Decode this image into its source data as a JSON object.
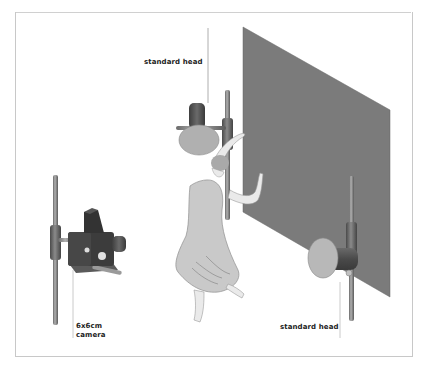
{
  "diagram": {
    "labels": {
      "top_head": "standard head",
      "bottom_head": "standard head",
      "camera_line1": "6x6cm",
      "camera_line2": "camera"
    },
    "elements": [
      {
        "name": "grey backdrop panel"
      },
      {
        "name": "standard head light (upper, behind dancer)"
      },
      {
        "name": "standard head light (lower right)"
      },
      {
        "name": "6x6cm camera on stand"
      },
      {
        "name": "dancer figure"
      }
    ],
    "colors": {
      "backdrop": "#7a7a7a",
      "light_housing": "#5a5a5a",
      "reflector_face": "#b5b5b5",
      "dress": "#c8c8c8",
      "skin": "#e8e8e8",
      "stand": "#8a8a8a",
      "camera": "#3c3c3c"
    }
  }
}
